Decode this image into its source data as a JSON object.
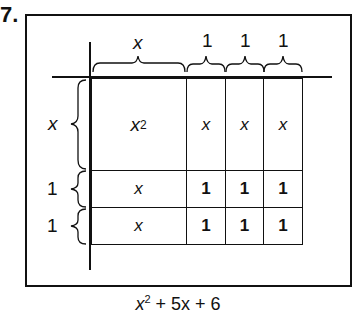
{
  "problem_number": "7.",
  "top_labels": [
    "x",
    "1",
    "1",
    "1"
  ],
  "side_labels": [
    "x",
    "1",
    "1"
  ],
  "grid": {
    "rows": [
      [
        "x²",
        "x",
        "x",
        "x"
      ],
      [
        "x",
        "1",
        "1",
        "1"
      ],
      [
        "x",
        "1",
        "1",
        "1"
      ]
    ]
  },
  "cells": {
    "r0c0_base": "x",
    "r0c0_exp": "2",
    "r0c1": "x",
    "r0c2": "x",
    "r0c3": "x",
    "r1c0": "x",
    "r1c1": "1",
    "r1c2": "1",
    "r1c3": "1",
    "r2c0": "x",
    "r2c1": "1",
    "r2c2": "1",
    "r2c3": "1"
  },
  "caption": {
    "base": "x",
    "exp": "2",
    "rest": " + 5x + 6"
  }
}
